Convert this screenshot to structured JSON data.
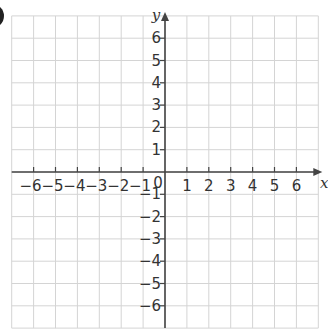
{
  "question_marker": ")",
  "chart_data": {
    "type": "coordinate_grid",
    "title": "",
    "xlabel": "x",
    "ylabel": "y",
    "xlim": [
      -7,
      7
    ],
    "ylim": [
      -7,
      7
    ],
    "grid": true,
    "x_ticks": [
      -6,
      -5,
      -4,
      -3,
      -2,
      -1,
      1,
      2,
      3,
      4,
      5,
      6
    ],
    "y_ticks": [
      -6,
      -5,
      -4,
      -3,
      -2,
      -1,
      1,
      2,
      3,
      4,
      5,
      6
    ],
    "origin_label": "0",
    "points": [],
    "colors": {
      "grid": "#d4d4d4",
      "axis": "#444444",
      "text": "#333333"
    }
  },
  "labels": {
    "x_axis": "x",
    "y_axis": "y",
    "origin": "0",
    "x_ticks": [
      "-6",
      "-5",
      "-4",
      "-3",
      "-2",
      "-1",
      "1",
      "2",
      "3",
      "4",
      "5",
      "6"
    ],
    "y_ticks_pos": [
      "6",
      "5",
      "4",
      "3",
      "2",
      "1"
    ],
    "y_ticks_neg": [
      "-1",
      "-2",
      "-3",
      "-4",
      "-5",
      "-6"
    ]
  }
}
